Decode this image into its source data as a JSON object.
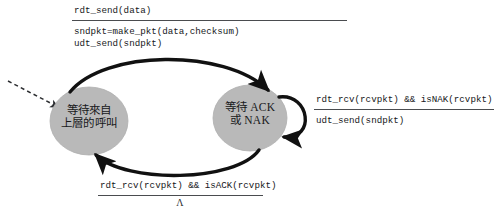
{
  "diagram": {
    "colors": {
      "state_fill": "#b9b9b9",
      "state_fill_edge": "#a9a9a9",
      "arrow": "#111111",
      "text": "#15171a",
      "rule": "#4a4c4f",
      "background": "#ffffff"
    },
    "states": [
      {
        "id": "wait-for-call-from-above",
        "lines": [
          "等待來自",
          "上層的呼叫"
        ],
        "cx": 89,
        "cy": 121,
        "rx": 39,
        "ry": 34
      },
      {
        "id": "wait-for-ack-or-nak",
        "lines": [
          "等待 ACK",
          "或 NAK"
        ],
        "cx": 250,
        "cy": 118,
        "rx": 37,
        "ry": 33
      }
    ],
    "transitions": {
      "top": {
        "id": "rdt-send-transition",
        "event": "rdt_send(data)",
        "actions": [
          "sndpkt=make_pkt(data,checksum)",
          "udt_send(sndpkt)"
        ]
      },
      "self_loop": {
        "id": "isnak-retransmit-transition",
        "event": "rdt_rcv(rcvpkt) && isNAK(rcvpkt)",
        "actions": [
          "udt_send(sndpkt)"
        ]
      },
      "bottom": {
        "id": "isack-transition",
        "event": "rdt_rcv(rcvpkt) && isACK(rcvpkt)",
        "actions": [
          "Λ"
        ]
      }
    },
    "start_arrow": {
      "id": "start-arrow",
      "style": "dashed"
    }
  }
}
